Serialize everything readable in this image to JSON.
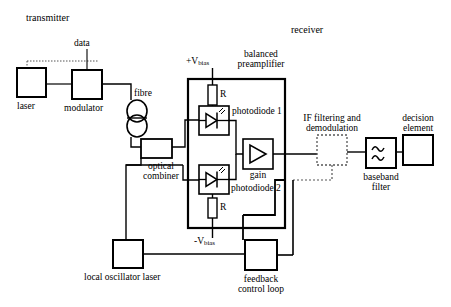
{
  "diagram": {
    "title_transmitter": "transmitter",
    "title_receiver": "receiver",
    "colors": {
      "stroke": "#000000",
      "background": "#ffffff",
      "dotted": "#555555"
    },
    "labels": {
      "data": "data",
      "laser": "laser",
      "modulator": "modulator",
      "fibre": "fibre",
      "optical_combiner_line1": "optical",
      "optical_combiner_line2": "combiner",
      "local_oscillator_laser": "local oscillator laser",
      "v_bias_pos_prefix": "+V",
      "v_bias_pos_sub": "bias",
      "v_bias_neg_prefix": "-V",
      "v_bias_neg_sub": "bias",
      "resistor_top": "R",
      "resistor_bottom": "R",
      "balanced_line1": "balanced",
      "balanced_line2": "preamplifier",
      "photodiode1": "photodiode 1",
      "photodiode2": "photodiode 2",
      "gain": "gain",
      "if_line1": "IF filtering and",
      "if_line2": "demodulation",
      "baseband_line1": "baseband",
      "baseband_line2": "filter",
      "decision_line1": "decision",
      "decision_line2": "element",
      "feedback_line1": "feedback",
      "feedback_line2": "control loop"
    },
    "blocks": [
      {
        "name": "laser",
        "x": 17,
        "y": 68,
        "w": 29,
        "h": 29
      },
      {
        "name": "modulator",
        "x": 72,
        "y": 70,
        "w": 30,
        "h": 29
      },
      {
        "name": "optical-combiner",
        "x": 141,
        "y": 139,
        "w": 31,
        "h": 19
      },
      {
        "name": "photodiode-1",
        "x": 199,
        "y": 106,
        "w": 30,
        "h": 29
      },
      {
        "name": "photodiode-2",
        "x": 199,
        "y": 165,
        "w": 30,
        "h": 29
      },
      {
        "name": "gain-amplifier",
        "x": 243,
        "y": 139,
        "w": 30,
        "h": 30
      },
      {
        "name": "balanced-preamplifier",
        "x": 188,
        "y": 79,
        "w": 97,
        "h": 149
      },
      {
        "name": "if-filtering-demodulation",
        "x": 317,
        "y": 135,
        "w": 30,
        "h": 30
      },
      {
        "name": "baseband-filter",
        "x": 366,
        "y": 138,
        "w": 30,
        "h": 30
      },
      {
        "name": "decision-element",
        "x": 403,
        "y": 135,
        "w": 30,
        "h": 30
      },
      {
        "name": "local-oscillator-laser",
        "x": 113,
        "y": 240,
        "w": 30,
        "h": 28
      },
      {
        "name": "feedback-control-loop",
        "x": 245,
        "y": 240,
        "w": 32,
        "h": 30
      }
    ]
  }
}
